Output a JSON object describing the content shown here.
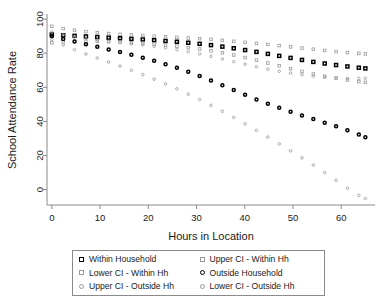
{
  "chart_data": {
    "type": "scatter",
    "title": "",
    "xlabel": "Hours in Location",
    "ylabel": "School Attendance Rate",
    "xlim": [
      -1,
      67
    ],
    "ylim": [
      -9,
      103
    ],
    "xticks": [
      0,
      10,
      20,
      30,
      40,
      50,
      60
    ],
    "yticks": [
      0,
      20,
      40,
      60,
      80,
      100
    ],
    "grid": false,
    "legend_position": "below-plot",
    "x": [
      0,
      2,
      4,
      6,
      8,
      10,
      12,
      14,
      16,
      18,
      20,
      22,
      24,
      26,
      28,
      30,
      32,
      34,
      36,
      38,
      40,
      42,
      44,
      46,
      48,
      50,
      52,
      54,
      56,
      58,
      60,
      62,
      64,
      65
    ],
    "series": [
      {
        "name": "Within Household",
        "marker": "square",
        "color": "#000000",
        "values": [
          91.0,
          90.6,
          90.3,
          90.0,
          89.7,
          89.4,
          89.1,
          88.8,
          88.5,
          88.2,
          87.9,
          87.5,
          87.1,
          86.7,
          86.2,
          85.7,
          85.1,
          84.4,
          83.6,
          82.8,
          81.9,
          81.0,
          80.0,
          79.0,
          78.0,
          77.0,
          76.0,
          75.0,
          74.2,
          73.4,
          72.7,
          72.0,
          71.4,
          71.1
        ]
      },
      {
        "name": "Upper CI - Within Hh",
        "marker": "square",
        "color": "#9a9a9a",
        "values": [
          95.8,
          94.6,
          93.7,
          93.0,
          92.4,
          91.9,
          91.5,
          91.1,
          90.8,
          90.5,
          90.2,
          89.9,
          89.6,
          89.3,
          89.0,
          88.7,
          88.3,
          87.9,
          87.4,
          86.9,
          86.4,
          85.9,
          85.4,
          84.8,
          84.2,
          83.6,
          83.0,
          82.4,
          81.8,
          81.2,
          80.7,
          80.2,
          79.8,
          79.6
        ]
      },
      {
        "name": "Lower CI - Within Hh",
        "marker": "square",
        "color": "#9a9a9a",
        "values": [
          86.2,
          86.6,
          86.9,
          87.0,
          87.0,
          86.9,
          86.7,
          86.5,
          86.2,
          85.9,
          85.6,
          85.1,
          84.6,
          84.1,
          83.4,
          82.7,
          81.9,
          81.0,
          79.9,
          78.8,
          77.5,
          76.2,
          74.8,
          73.4,
          72.0,
          70.6,
          69.2,
          67.9,
          66.8,
          65.8,
          64.9,
          64.0,
          63.2,
          62.9
        ]
      },
      {
        "name": "Outside Household",
        "marker": "circle",
        "color": "#000000",
        "values": [
          90.0,
          88.6,
          87.3,
          86.0,
          84.7,
          83.4,
          82.1,
          80.8,
          79.4,
          78.0,
          76.5,
          74.9,
          73.2,
          71.4,
          69.5,
          67.4,
          65.2,
          62.9,
          60.5,
          58.1,
          55.7,
          53.4,
          51.2,
          49.1,
          47.1,
          45.2,
          43.4,
          41.6,
          39.8,
          38.0,
          36.1,
          34.1,
          31.9,
          30.7
        ]
      },
      {
        "name": "Upper CI - Outside Hh",
        "marker": "circle",
        "color": "#9a9a9a",
        "values": [
          92.4,
          91.0,
          89.9,
          89.0,
          88.2,
          87.5,
          86.9,
          86.3,
          85.7,
          85.1,
          84.5,
          83.8,
          83.0,
          82.1,
          81.1,
          80.0,
          78.8,
          77.5,
          76.2,
          74.9,
          73.6,
          72.3,
          71.1,
          70.0,
          69.0,
          68.1,
          67.3,
          66.6,
          66.0,
          65.6,
          65.3,
          65.2,
          65.2,
          65.3
        ]
      },
      {
        "name": "Lower CI - Outside Hh",
        "marker": "circle",
        "color": "#9a9a9a",
        "values": [
          88.0,
          85.3,
          82.9,
          80.7,
          78.6,
          76.6,
          74.6,
          72.6,
          70.5,
          68.4,
          66.2,
          63.9,
          61.5,
          59.0,
          56.4,
          53.7,
          50.9,
          48.0,
          45.0,
          41.9,
          38.7,
          35.5,
          32.2,
          28.8,
          25.4,
          21.9,
          18.4,
          14.8,
          11.1,
          7.3,
          3.4,
          -0.6,
          -4.0,
          -5.2
        ]
      }
    ]
  },
  "legend": {
    "entries": [
      {
        "label": "Within Household",
        "marker": "square-dark"
      },
      {
        "label": "Upper CI - Within Hh",
        "marker": "square-gray"
      },
      {
        "label": "Lower CI - Within Hh",
        "marker": "square-gray"
      },
      {
        "label": "Outside Household",
        "marker": "circle-dark"
      },
      {
        "label": "Upper CI - Outside Hh",
        "marker": "circle-gray"
      },
      {
        "label": "Lower CI - Outside Hh",
        "marker": "circle-gray"
      }
    ]
  },
  "colors": {
    "axis": "#8a8a8a",
    "dark_series": "#000000",
    "ci_series": "#9a9a9a",
    "text": "#1a1a1a"
  }
}
